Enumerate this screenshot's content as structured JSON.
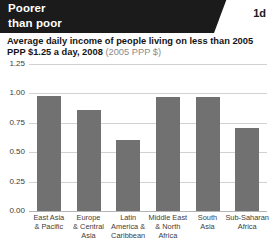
{
  "header": {
    "title": "Poorer\nthan poor",
    "badge": "1d"
  },
  "subtitle": {
    "main": "Average daily income of people living on less than 2005 PPP $1.25 a day, 2008 ",
    "paren": "(2005 PPP $)"
  },
  "colors": {
    "header_background": "#1b1b1b",
    "header_text": "#ffffff",
    "bar": "#717171",
    "grid": "#d2d2d2",
    "axis_text": "#3c3c3c",
    "subtitle_muted": "#8a8a8a"
  },
  "chart_data": {
    "type": "bar",
    "title": "Average daily income of people living on less than 2005 PPP $1.25 a day, 2008",
    "subtitle": "(2005 PPP $)",
    "xlabel": "",
    "ylabel": "",
    "ylim": [
      0,
      1.25
    ],
    "yticks": [
      0.0,
      0.25,
      0.5,
      0.75,
      1.0,
      1.25
    ],
    "ytick_labels": [
      "0.00",
      "0.25",
      "0.50",
      "0.75",
      "1.00",
      "1.25"
    ],
    "grid": true,
    "legend": false,
    "categories": [
      "East Asia\n& Pacific",
      "Europe\n& Central\nAsia",
      "Latin\nAmerica &\nCaribbean",
      "Middle East\n& North\nAfrica",
      "South\nAsia",
      "Sub-Saharan\nAfrica"
    ],
    "values": [
      0.98,
      0.86,
      0.6,
      0.97,
      0.97,
      0.71
    ]
  }
}
